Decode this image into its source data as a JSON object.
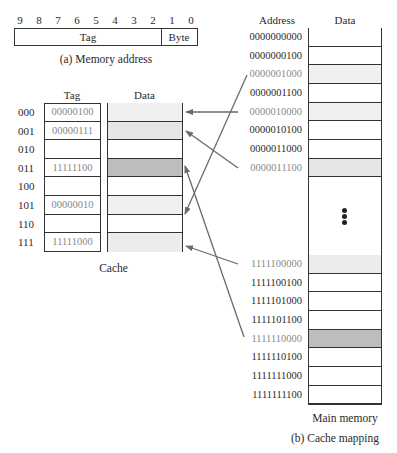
{
  "memory_address": {
    "bit_numbers": [
      "9",
      "8",
      "7",
      "6",
      "5",
      "4",
      "3",
      "2",
      "1",
      "0"
    ],
    "tag_label": "Tag",
    "byte_label": "Byte",
    "caption": "(a) Memory address"
  },
  "cache": {
    "tag_header": "Tag",
    "data_header": "Data",
    "caption": "Cache",
    "rows": [
      {
        "index": "000",
        "tag": "00000100",
        "fill": "#f0f0f0"
      },
      {
        "index": "001",
        "tag": "00000111",
        "fill": "#e6e6e6"
      },
      {
        "index": "010",
        "tag": "",
        "fill": "#ffffff"
      },
      {
        "index": "011",
        "tag": "11111100",
        "fill": "#bdbdbd"
      },
      {
        "index": "100",
        "tag": "",
        "fill": "#ffffff"
      },
      {
        "index": "101",
        "tag": "00000010",
        "fill": "#f0f0f0"
      },
      {
        "index": "110",
        "tag": "",
        "fill": "#ffffff"
      },
      {
        "index": "111",
        "tag": "11111000",
        "fill": "#ececec"
      }
    ]
  },
  "main_memory": {
    "address_header": "Address",
    "data_header": "Data",
    "caption": "Main memory",
    "top_rows": [
      {
        "address": "0000000000",
        "fill": "#ffffff",
        "mapped": false
      },
      {
        "address": "0000000100",
        "fill": "#ffffff",
        "mapped": false
      },
      {
        "address": "0000001000",
        "fill": "#f0f0f0",
        "mapped": true
      },
      {
        "address": "0000001100",
        "fill": "#ffffff",
        "mapped": false
      },
      {
        "address": "0000010000",
        "fill": "#f0f0f0",
        "mapped": true
      },
      {
        "address": "0000010100",
        "fill": "#ffffff",
        "mapped": false
      },
      {
        "address": "0000011000",
        "fill": "#ffffff",
        "mapped": false
      },
      {
        "address": "0000011100",
        "fill": "#e6e6e6",
        "mapped": true
      }
    ],
    "ellipsis": "⋮",
    "bottom_rows": [
      {
        "address": "1111100000",
        "fill": "#ececec",
        "mapped": true
      },
      {
        "address": "1111100100",
        "fill": "#ffffff",
        "mapped": false
      },
      {
        "address": "1111101000",
        "fill": "#ffffff",
        "mapped": false
      },
      {
        "address": "1111101100",
        "fill": "#ffffff",
        "mapped": false
      },
      {
        "address": "1111110000",
        "fill": "#bdbdbd",
        "mapped": true
      },
      {
        "address": "1111110100",
        "fill": "#ffffff",
        "mapped": false
      },
      {
        "address": "1111111000",
        "fill": "#ffffff",
        "mapped": false
      },
      {
        "address": "1111111100",
        "fill": "#ffffff",
        "mapped": false
      }
    ]
  },
  "figure_caption": "(b) Cache mapping",
  "mappings": [
    {
      "from": "0000010000",
      "to_cache_index": "000"
    },
    {
      "from": "0000011100",
      "to_cache_index": "001"
    },
    {
      "from": "1111110000",
      "to_cache_index": "011"
    },
    {
      "from": "0000001000",
      "to_cache_index": "101"
    },
    {
      "from": "1111100000",
      "to_cache_index": "111"
    }
  ],
  "colors": {
    "line": "#333333",
    "arrow": "#6a6a6a",
    "mapped_text": "#8a8a8a",
    "text": "#2a2a2a"
  }
}
